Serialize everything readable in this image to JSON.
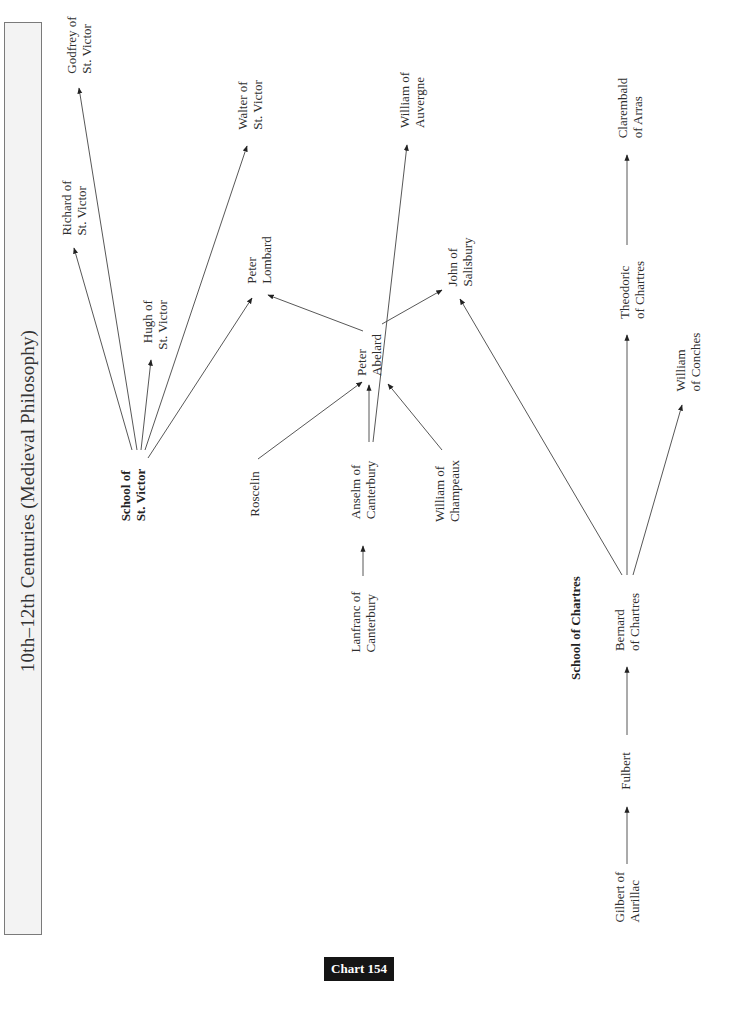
{
  "title": "10th–12th Centuries (Medieval Philosophy)",
  "footer_label": "Chart 154",
  "nodes": {
    "godfrey": {
      "line1": "Godfrey of",
      "line2": "St. Victor"
    },
    "richard": {
      "line1": "Richard of",
      "line2": "St. Victor"
    },
    "hugh": {
      "line1": "Hugh of",
      "line2": "St. Victor"
    },
    "walter": {
      "line1": "Walter of",
      "line2": "St. Victor"
    },
    "school_st_victor": {
      "line1": "School of",
      "line2": "St. Victor"
    },
    "peter_lombard": {
      "line1": "Peter",
      "line2": "Lombard"
    },
    "roscelin": {
      "line1": "Roscelin"
    },
    "peter_abelard": {
      "line1": "Peter",
      "line2": "Abelard"
    },
    "william_auvergne": {
      "line1": "William of",
      "line2": "Auvergne"
    },
    "anselm": {
      "line1": "Anselm of",
      "line2": "Canterbury"
    },
    "lanfranc": {
      "line1": "Lanfranc of",
      "line2": "Canterbury"
    },
    "john_salisbury": {
      "line1": "John of",
      "line2": "Salisbury"
    },
    "william_champeaux": {
      "line1": "William of",
      "line2": "Champeaux"
    },
    "school_chartres": {
      "line1": "School of Chartres"
    },
    "bernard": {
      "line1": "Bernard",
      "line2": "of Chartres"
    },
    "fulbert": {
      "line1": "Fulbert"
    },
    "gilbert": {
      "line1": "Gilbert of",
      "line2": "Aurillac"
    },
    "theodoric": {
      "line1": "Theodoric",
      "line2": "of Chartres"
    },
    "william_conches": {
      "line1": "William",
      "line2": "of Conches"
    },
    "clarembald": {
      "line1": "Clarembald",
      "line2": "of Arras"
    }
  },
  "edges": [
    {
      "from": "School of St. Victor",
      "to": "Richard of St. Victor"
    },
    {
      "from": "School of St. Victor",
      "to": "Godfrey of St. Victor"
    },
    {
      "from": "School of St. Victor",
      "to": "Hugh of St. Victor"
    },
    {
      "from": "School of St. Victor",
      "to": "Walter of St. Victor"
    },
    {
      "from": "School of St. Victor",
      "to": "Peter Lombard"
    },
    {
      "from": "Roscelin",
      "to": "Peter Abelard"
    },
    {
      "from": "Anselm of Canterbury",
      "to": "Peter Abelard"
    },
    {
      "from": "Anselm of Canterbury",
      "to": "William of Auvergne"
    },
    {
      "from": "William of Champeaux",
      "to": "Peter Abelard"
    },
    {
      "from": "Lanfranc of Canterbury",
      "to": "Anselm of Canterbury"
    },
    {
      "from": "Peter Abelard",
      "to": "Peter Lombard"
    },
    {
      "from": "Peter Abelard",
      "to": "John of Salisbury"
    },
    {
      "from": "Bernard of Chartres",
      "to": "John of Salisbury"
    },
    {
      "from": "Bernard of Chartres",
      "to": "Theodoric of Chartres"
    },
    {
      "from": "Bernard of Chartres",
      "to": "William of Conches"
    },
    {
      "from": "Theodoric of Chartres",
      "to": "Clarembald of Arras"
    },
    {
      "from": "Fulbert",
      "to": "Bernard of Chartres"
    },
    {
      "from": "Gilbert of Aurillac",
      "to": "Fulbert"
    }
  ]
}
